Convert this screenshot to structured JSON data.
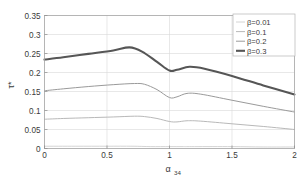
{
  "chart_data": {
    "type": "line",
    "title": "",
    "xlabel": "α₃₄",
    "xlabel_base": "α",
    "xlabel_sub": "34",
    "ylabel": "τ*",
    "xlim": [
      0,
      2
    ],
    "ylim": [
      0,
      0.35
    ],
    "xticks": [
      0,
      0.5,
      1,
      1.5,
      2
    ],
    "xticklabels": [
      "0",
      "0.5",
      "1",
      "1.5",
      "2"
    ],
    "yticks": [
      0,
      0.05,
      0.1,
      0.15,
      0.2,
      0.25,
      0.3,
      0.35
    ],
    "yticklabels": [
      "0",
      "0.05",
      "0.1",
      "0.15",
      "0.2",
      "0.25",
      "0.3",
      "0.35"
    ],
    "grid": true,
    "legend_position": "upper-right",
    "series": [
      {
        "name": "β=0.01",
        "color": "#c9c9c9",
        "width": 0.8,
        "x": [
          0.0,
          0.25,
          0.5,
          0.7,
          0.85,
          1.0,
          1.1,
          1.2,
          1.5,
          1.75,
          2.0
        ],
        "values": [
          0.006,
          0.006,
          0.006,
          0.006,
          0.005,
          0.005,
          0.005,
          0.005,
          0.005,
          0.004,
          0.004
        ]
      },
      {
        "name": "β=0.1",
        "color": "#b0b0b0",
        "width": 0.9,
        "x": [
          0.0,
          0.15,
          0.35,
          0.55,
          0.72,
          0.8,
          0.9,
          1.0,
          1.06,
          1.14,
          1.25,
          1.5,
          1.75,
          2.0
        ],
        "values": [
          0.077,
          0.079,
          0.081,
          0.083,
          0.085,
          0.084,
          0.079,
          0.071,
          0.07,
          0.073,
          0.072,
          0.065,
          0.058,
          0.05
        ]
      },
      {
        "name": "β=0.2",
        "color": "#9a9a9a",
        "width": 1.0,
        "x": [
          0.0,
          0.15,
          0.35,
          0.55,
          0.72,
          0.8,
          0.9,
          1.0,
          1.06,
          1.14,
          1.25,
          1.5,
          1.75,
          2.0
        ],
        "values": [
          0.152,
          0.157,
          0.163,
          0.168,
          0.171,
          0.169,
          0.155,
          0.134,
          0.136,
          0.145,
          0.143,
          0.127,
          0.111,
          0.096
        ]
      },
      {
        "name": "β=0.3",
        "color": "#565656",
        "width": 2.1,
        "x": [
          0.0,
          0.15,
          0.35,
          0.55,
          0.68,
          0.78,
          0.9,
          1.0,
          1.06,
          1.16,
          1.28,
          1.5,
          1.75,
          2.0
        ],
        "values": [
          0.234,
          0.24,
          0.249,
          0.258,
          0.266,
          0.255,
          0.228,
          0.205,
          0.207,
          0.215,
          0.21,
          0.191,
          0.166,
          0.142
        ]
      }
    ]
  },
  "legend": {
    "entries": [
      {
        "label": "β=0.01"
      },
      {
        "label": "β=0.1"
      },
      {
        "label": "β=0.2"
      },
      {
        "label": "β=0.3"
      }
    ]
  }
}
